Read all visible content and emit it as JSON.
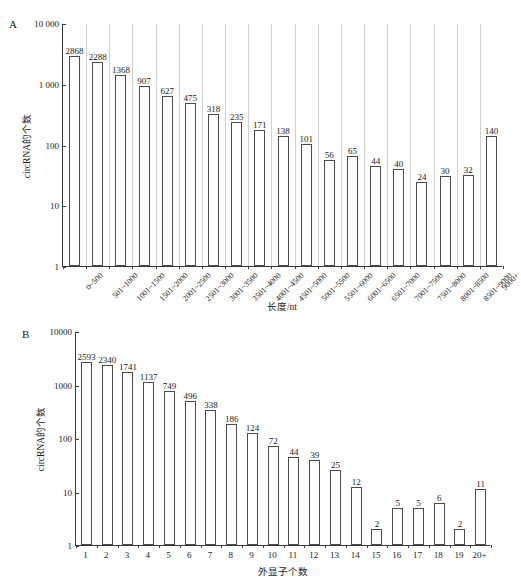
{
  "figure": {
    "panel_a_letter": "A",
    "panel_b_letter": "B"
  },
  "chart_data": [
    {
      "id": "panel_a",
      "type": "bar",
      "title": "",
      "panel_label": "A",
      "xlabel": "长度/nt",
      "ylabel": "circRNA的个数",
      "yscale": "log",
      "ylim": [
        1,
        10000
      ],
      "ytick_labels": [
        "10 000",
        "1 000",
        "100",
        "10",
        "1"
      ],
      "ytick_values": [
        10000,
        1000,
        100,
        10,
        1
      ],
      "grid": false,
      "legend": null,
      "categories": [
        "0~500",
        "501~1000",
        "1001~1500",
        "1501~2000",
        "2001~2500",
        "2501~3000",
        "3001~3500",
        "3501~4000",
        "4001~4500",
        "4501~5000",
        "5001~5500",
        "5501~6000",
        "6001~6500",
        "6501~7000",
        "7001~7500",
        "7501~8000",
        "8001~8500",
        "8501~9000",
        "9000+"
      ],
      "values": [
        2868,
        2288,
        1368,
        907,
        627,
        475,
        318,
        235,
        171,
        138,
        101,
        56,
        65,
        44,
        40,
        24,
        30,
        32,
        140
      ]
    },
    {
      "id": "panel_b",
      "type": "bar",
      "title": "",
      "panel_label": "B",
      "xlabel": "外显子个数",
      "ylabel": "circRNA的个数",
      "yscale": "log",
      "ylim": [
        1,
        10000
      ],
      "ytick_labels": [
        "10000",
        "1000",
        "100",
        "10",
        "1"
      ],
      "ytick_values": [
        10000,
        1000,
        100,
        10,
        1
      ],
      "grid": false,
      "legend": null,
      "categories": [
        "1",
        "2",
        "3",
        "4",
        "5",
        "6",
        "7",
        "8",
        "9",
        "10",
        "11",
        "12",
        "13",
        "14",
        "15",
        "16",
        "17",
        "18",
        "19",
        "20+"
      ],
      "values": [
        2593,
        2340,
        1741,
        1137,
        749,
        496,
        338,
        186,
        124,
        72,
        44,
        39,
        25,
        12,
        2,
        5,
        5,
        6,
        2,
        11
      ]
    }
  ]
}
